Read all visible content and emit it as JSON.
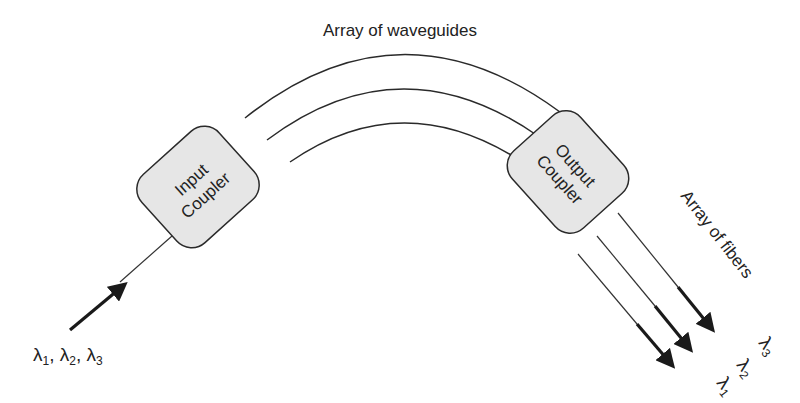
{
  "title": "Array of waveguides",
  "input_coupler": {
    "line1": "Input",
    "line2": "Coupler"
  },
  "output_coupler": {
    "line1": "Output",
    "line2": "Coupler"
  },
  "fibers_label": "Array of fibers",
  "input_wavelengths": {
    "l1": "λ",
    "s1": "1",
    "sep1": ", ",
    "l2": "λ",
    "s2": "2",
    "sep2": ", ",
    "l3": "λ",
    "s3": "3"
  },
  "output_wavelengths": [
    {
      "symbol": "λ",
      "sub": "1"
    },
    {
      "symbol": "λ",
      "sub": "2"
    },
    {
      "symbol": "λ",
      "sub": "3"
    }
  ],
  "colors": {
    "line": "#2a2a2a",
    "coupler_fill": "#e6e6e6",
    "text": "#222222"
  }
}
